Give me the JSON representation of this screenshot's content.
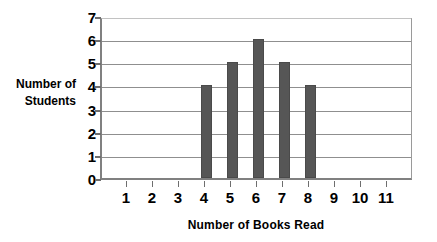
{
  "chart_data": {
    "type": "bar",
    "title": "",
    "xlabel": "Number of Books Read",
    "ylabel": "Number of Students",
    "ylabel_line1": "Number of",
    "ylabel_line2": "Students",
    "categories": [
      "1",
      "2",
      "3",
      "4",
      "5",
      "6",
      "7",
      "8",
      "9",
      "10",
      "11"
    ],
    "values": [
      0,
      0,
      0,
      4,
      5,
      6,
      5,
      4,
      0,
      0,
      0
    ],
    "ylim": [
      0,
      7
    ],
    "ytick_labels": [
      "0",
      "1",
      "2",
      "3",
      "4",
      "5",
      "6",
      "7"
    ],
    "ytick_values": [
      0,
      1,
      2,
      3,
      4,
      5,
      6,
      7
    ],
    "grid": true,
    "legend": "none",
    "bar_color": "#565656",
    "grid_color": "#8f8f8f",
    "axis_color": "#808080",
    "background_color": "#ffffff"
  }
}
